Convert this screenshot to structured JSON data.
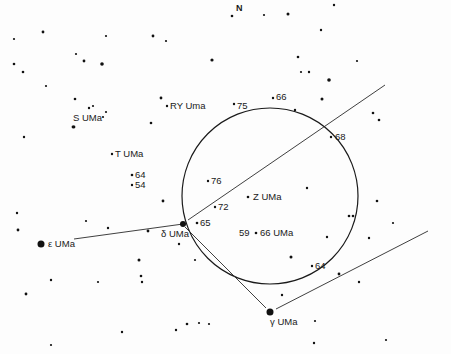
{
  "chart_data": {
    "type": "star-chart",
    "title": "",
    "orientation_label": "N",
    "field_circle": {
      "cx": 270,
      "cy": 196,
      "r": 88
    },
    "lines": [
      {
        "name": "delta-to-epsilon",
        "x1": 183,
        "y1": 224,
        "x2": 74,
        "y2": 239
      },
      {
        "name": "delta-to-northeast",
        "x1": 188,
        "y1": 220,
        "x2": 385,
        "y2": 85
      },
      {
        "name": "delta-to-gamma",
        "x1": 185,
        "y1": 227,
        "x2": 266,
        "y2": 308
      },
      {
        "name": "gamma-to-east",
        "x1": 276,
        "y1": 309,
        "x2": 428,
        "y2": 231
      }
    ],
    "labeled_stars": [
      {
        "id": "epsilon-uma",
        "label": "ε UMa",
        "x": 41,
        "y": 244,
        "r": 3.5,
        "lx": 48,
        "ly": 247
      },
      {
        "id": "delta-uma",
        "label": "δ UMa",
        "x": 183,
        "y": 224,
        "r": 3,
        "lx": 161,
        "ly": 237
      },
      {
        "id": "gamma-uma",
        "label": "γ UMa",
        "x": 270,
        "y": 312,
        "r": 3.5,
        "lx": 270,
        "ly": 325
      },
      {
        "id": "s-uma",
        "label": "S UMa",
        "x": 74,
        "y": 127,
        "r": 1.4,
        "lx": 73,
        "ly": 121
      },
      {
        "id": "ry-uma",
        "label": "RY Uma",
        "x": 167,
        "y": 106,
        "r": 1.2,
        "lx": 170,
        "ly": 109
      },
      {
        "id": "t-uma",
        "label": "T UMa",
        "x": 112,
        "y": 154,
        "r": 1.2,
        "lx": 115,
        "ly": 157
      },
      {
        "id": "z-uma",
        "label": "Z UMa",
        "x": 248,
        "y": 197,
        "r": 1.3,
        "lx": 253,
        "ly": 200
      },
      {
        "id": "66-uma",
        "label": "66 UMa",
        "x": 256,
        "y": 233,
        "r": 1.3,
        "lx": 260,
        "ly": 236
      },
      {
        "id": "star-59",
        "label": "59",
        "x": 0,
        "y": 0,
        "r": 0,
        "lx": 239,
        "ly": 236
      },
      {
        "id": "star-64-left",
        "label": "64",
        "x": 132,
        "y": 175,
        "r": 1.3,
        "lx": 135,
        "ly": 178
      },
      {
        "id": "star-54",
        "label": "54",
        "x": 132,
        "y": 185,
        "r": 1.2,
        "lx": 135,
        "ly": 188
      },
      {
        "id": "star-75",
        "label": "75",
        "x": 234,
        "y": 104,
        "r": 1.2,
        "lx": 237,
        "ly": 109
      },
      {
        "id": "star-66-top",
        "label": "66",
        "x": 273,
        "y": 98,
        "r": 1.2,
        "lx": 276,
        "ly": 100
      },
      {
        "id": "star-68",
        "label": "68",
        "x": 331,
        "y": 137,
        "r": 1.2,
        "lx": 335,
        "ly": 140
      },
      {
        "id": "star-76",
        "label": "76",
        "x": 208,
        "y": 181,
        "r": 1.2,
        "lx": 211,
        "ly": 184
      },
      {
        "id": "star-72",
        "label": "72",
        "x": 215,
        "y": 207,
        "r": 1.2,
        "lx": 218,
        "ly": 210
      },
      {
        "id": "star-65",
        "label": "65",
        "x": 197,
        "y": 223,
        "r": 1.3,
        "lx": 200,
        "ly": 226
      },
      {
        "id": "star-64-right",
        "label": "64",
        "x": 312,
        "y": 266,
        "r": 1.2,
        "lx": 315,
        "ly": 269
      }
    ],
    "field_stars": [
      [
        14,
        39,
        1.1
      ],
      [
        43,
        32,
        1.4
      ],
      [
        106,
        36,
        1.1
      ],
      [
        153,
        36,
        1.4
      ],
      [
        166,
        41,
        1.1
      ],
      [
        14,
        64,
        1.3
      ],
      [
        23,
        72,
        1.3
      ],
      [
        76,
        54,
        1.1
      ],
      [
        84,
        61,
        1.4
      ],
      [
        102,
        64,
        1.8
      ],
      [
        212,
        60,
        1.6
      ],
      [
        46,
        86,
        1.1
      ],
      [
        75,
        99,
        1.3
      ],
      [
        89,
        108,
        1.2
      ],
      [
        93,
        106,
        1.1
      ],
      [
        106,
        112,
        1.1
      ],
      [
        103,
        117,
        1.1
      ],
      [
        73,
        127,
        1.4
      ],
      [
        151,
        123,
        1.3
      ],
      [
        24,
        137,
        1.2
      ],
      [
        161,
        98,
        1.4
      ],
      [
        264,
        15,
        1.1
      ],
      [
        232,
        16,
        1.3
      ],
      [
        288,
        14,
        1.5
      ],
      [
        334,
        5,
        1.2
      ],
      [
        321,
        30,
        1.2
      ],
      [
        298,
        57,
        1.3
      ],
      [
        301,
        72,
        1.1
      ],
      [
        309,
        72,
        1.2
      ],
      [
        357,
        61,
        1.1
      ],
      [
        329,
        80,
        1.8
      ],
      [
        322,
        99,
        1.5
      ],
      [
        295,
        110,
        1.2
      ],
      [
        373,
        113,
        1.3
      ],
      [
        379,
        120,
        1.3
      ],
      [
        17,
        213,
        1.2
      ],
      [
        18,
        230,
        1.4
      ],
      [
        86,
        221,
        1.1
      ],
      [
        108,
        228,
        1.2
      ],
      [
        163,
        201,
        1.4
      ],
      [
        148,
        231,
        1.4
      ],
      [
        179,
        244,
        1.2
      ],
      [
        195,
        260,
        1.1
      ],
      [
        139,
        260,
        1.5
      ],
      [
        141,
        276,
        1.3
      ],
      [
        51,
        280,
        1.2
      ],
      [
        98,
        282,
        1.1
      ],
      [
        26,
        294,
        1.4
      ],
      [
        142,
        282,
        1.2
      ],
      [
        122,
        332,
        1.2
      ],
      [
        176,
        330,
        1.2
      ],
      [
        187,
        324,
        1.3
      ],
      [
        199,
        323,
        1.1
      ],
      [
        209,
        324,
        1.1
      ],
      [
        51,
        345,
        1.1
      ],
      [
        307,
        188,
        1.2
      ],
      [
        291,
        257,
        1.5
      ],
      [
        327,
        237,
        1.2
      ],
      [
        349,
        216,
        1.3
      ],
      [
        353,
        216,
        1.3
      ],
      [
        377,
        201,
        1.3
      ],
      [
        393,
        223,
        1.1
      ],
      [
        369,
        238,
        1.2
      ],
      [
        339,
        274,
        1.4
      ],
      [
        359,
        282,
        1.2
      ],
      [
        282,
        295,
        1.2
      ],
      [
        314,
        343,
        1.2
      ],
      [
        386,
        340,
        1.1
      ],
      [
        315,
        321,
        1.1
      ]
    ]
  }
}
